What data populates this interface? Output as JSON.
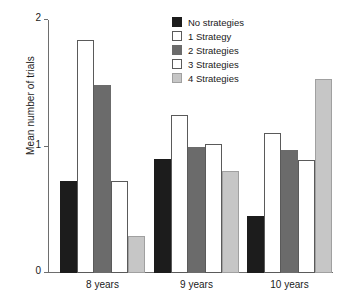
{
  "chart_data": {
    "type": "bar",
    "title": "",
    "xlabel": "",
    "ylabel": "Mean number of trials",
    "categories": [
      "8 years",
      "9 years",
      "10 years"
    ],
    "ylim": [
      0,
      2
    ],
    "yticks": [
      0,
      1,
      2
    ],
    "ytick_labels": [
      "0",
      "1",
      "2"
    ],
    "grid": false,
    "legend_position": "top-center-right",
    "series": [
      {
        "name": "No strategies",
        "color": "#1c1c1c",
        "swatch": "s-black",
        "values": [
          0.73,
          0.9,
          0.45
        ]
      },
      {
        "name": "1 Strategy",
        "color": "#ffffff",
        "swatch": "s-white",
        "values": [
          1.84,
          1.25,
          1.11
        ]
      },
      {
        "name": "2 Strategies",
        "color": "#6b6b6b",
        "swatch": "s-dgray",
        "values": [
          1.49,
          1.0,
          0.97
        ]
      },
      {
        "name": "3 Strategies",
        "color": "#ffffff",
        "swatch": "s-white",
        "values": [
          0.73,
          1.02,
          0.89
        ]
      },
      {
        "name": "4 Strategies",
        "color": "#c6c6c6",
        "swatch": "s-lgray",
        "values": [
          0.29,
          0.81,
          1.53
        ]
      }
    ]
  },
  "axis": {
    "y_title": "Mean number of trials"
  }
}
